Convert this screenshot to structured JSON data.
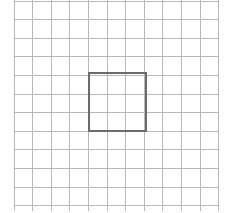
{
  "canvas": {
    "width": 225,
    "height": 213,
    "background_color": "#ffffff"
  },
  "grid": {
    "label": "square-grid",
    "line_color": "#b8b8b8",
    "line_width": 1,
    "columns": 11,
    "rows": 11,
    "cell_width": 18.6,
    "cell_height": 18.6,
    "origin_x": 14,
    "origin_y": 1,
    "extent_x": 218.6,
    "extent_y": 205.6,
    "vertical_line_positions": [
      14,
      32.6,
      51.2,
      69.8,
      88.4,
      107,
      125.6,
      144.2,
      162.8,
      181.4,
      200,
      218.6
    ],
    "horizontal_line_positions": [
      1,
      19.6,
      38.2,
      56.8,
      75.4,
      94,
      112.6,
      131.2,
      149.8,
      168.4,
      187,
      205.6
    ],
    "vertical_line_top": 0,
    "vertical_line_bottom": 211
  },
  "highlight": {
    "label": "selected-region",
    "stroke_color": "#6b6b6b",
    "stroke_width": 2,
    "fill": "none",
    "x": 89,
    "y": 73,
    "width": 57,
    "height": 58,
    "span_columns": 3,
    "span_rows": 3,
    "center_x": 117.5,
    "center_y": 102
  },
  "chart_data": {
    "type": "diagram",
    "title": "",
    "grid_size": "11 x 11",
    "highlighted_cells": [
      {
        "col": 5,
        "row": 5
      },
      {
        "col": 6,
        "row": 5
      },
      {
        "col": 7,
        "row": 5
      },
      {
        "col": 5,
        "row": 6
      },
      {
        "col": 6,
        "row": 6
      },
      {
        "col": 7,
        "row": 6
      },
      {
        "col": 5,
        "row": 7
      },
      {
        "col": 6,
        "row": 7
      },
      {
        "col": 7,
        "row": 7
      }
    ]
  }
}
